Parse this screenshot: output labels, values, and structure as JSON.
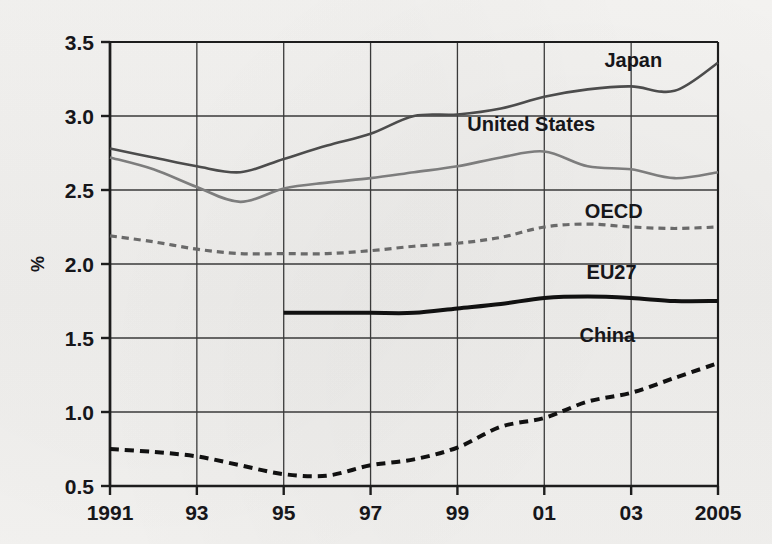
{
  "chart_data": {
    "type": "line",
    "title": "",
    "xlabel": "",
    "ylabel": "%",
    "xlim": [
      1991,
      2005
    ],
    "ylim": [
      0.5,
      3.5
    ],
    "grid": true,
    "legend_position": "inline-right-labels",
    "x": [
      1991,
      1992,
      1993,
      1994,
      1995,
      1996,
      1997,
      1998,
      1999,
      2000,
      2001,
      2002,
      2003,
      2004,
      2005
    ],
    "x_tick_labels": [
      "1991",
      "93",
      "95",
      "97",
      "99",
      "01",
      "03",
      "2005"
    ],
    "x_tick_values": [
      1991,
      1993,
      1995,
      1997,
      1999,
      2001,
      2003,
      2005
    ],
    "y_tick_labels": [
      "3.5",
      "3.0",
      "2.5",
      "2.0",
      "1.5",
      "1.0",
      "0.5"
    ],
    "y_tick_values": [
      3.5,
      3.0,
      2.5,
      2.0,
      1.5,
      1.0,
      0.5
    ],
    "series": [
      {
        "name": "Japan",
        "label": "Japan",
        "color": "#4c4c4c",
        "style": "solid",
        "width": 2.6,
        "label_x": 2003.05,
        "label_y": 3.33,
        "values": [
          2.78,
          2.72,
          2.66,
          2.62,
          2.71,
          2.8,
          2.88,
          3.0,
          3.01,
          3.05,
          3.13,
          3.18,
          3.2,
          3.17,
          3.36
        ]
      },
      {
        "name": "United States",
        "label": "United States",
        "color": "#7d7d7d",
        "style": "solid",
        "width": 2.6,
        "label_x": 2000.7,
        "label_y": 2.9,
        "values": [
          2.72,
          2.64,
          2.52,
          2.42,
          2.51,
          2.55,
          2.58,
          2.62,
          2.66,
          2.72,
          2.76,
          2.66,
          2.64,
          2.58,
          2.62
        ]
      },
      {
        "name": "OECD",
        "label": "OECD",
        "color": "#6a6a6a",
        "style": "dashed",
        "width": 3.2,
        "label_x": 2002.6,
        "label_y": 2.31,
        "values": [
          2.19,
          2.15,
          2.1,
          2.07,
          2.07,
          2.07,
          2.09,
          2.12,
          2.14,
          2.18,
          2.25,
          2.27,
          2.25,
          2.24,
          2.25
        ]
      },
      {
        "name": "EU27",
        "label": "EU27",
        "color": "#111111",
        "style": "solid",
        "width": 4.0,
        "label_x": 2002.55,
        "label_y": 1.9,
        "start_year": 1995,
        "values": [
          null,
          null,
          null,
          null,
          1.67,
          1.67,
          1.67,
          1.67,
          1.7,
          1.73,
          1.77,
          1.78,
          1.77,
          1.75,
          1.75
        ]
      },
      {
        "name": "China",
        "label": "China",
        "color": "#111111",
        "style": "dashed",
        "width": 4.0,
        "label_x": 2002.45,
        "label_y": 1.47,
        "values": [
          0.75,
          0.73,
          0.7,
          0.64,
          0.58,
          0.57,
          0.64,
          0.68,
          0.76,
          0.9,
          0.96,
          1.07,
          1.13,
          1.23,
          1.33
        ]
      }
    ]
  }
}
